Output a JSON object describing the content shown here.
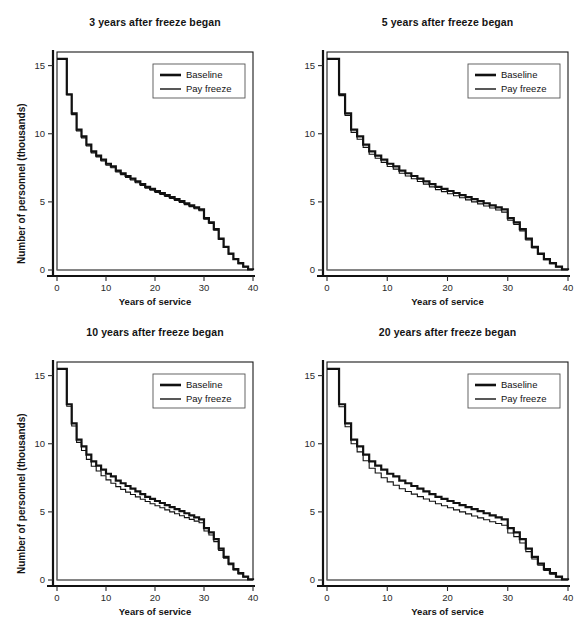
{
  "figure": {
    "panel_layout": "2x2",
    "background": "#ffffff"
  },
  "axis": {
    "xlabel": "Years of service",
    "ylabel": "Number of personnel (thousands)",
    "xticks": [
      "0",
      "10",
      "20",
      "30",
      "40"
    ],
    "yticks": [
      "0",
      "5",
      "10",
      "15"
    ],
    "xlim": [
      0,
      40
    ],
    "ylim": [
      0,
      16
    ]
  },
  "legend": {
    "position": "top-right",
    "entries": [
      {
        "label": "Baseline",
        "color": "#111111",
        "width": 2.6
      },
      {
        "label": "Pay freeze",
        "color": "#111111",
        "width": 1.4
      }
    ]
  },
  "colors": {
    "baseline": "#111111",
    "pay_freeze": "#111111",
    "frame": "#1a1a1a",
    "zero_line": "#8a8a8a",
    "tick": "#2a2a2a"
  },
  "chart_data": {
    "type": "line",
    "xlabel": "Years of service",
    "ylabel": "Number of personnel (thousands)",
    "xlim": [
      0,
      40
    ],
    "ylim": [
      0,
      16
    ],
    "grid": false,
    "legend": [
      "Baseline",
      "Pay freeze"
    ],
    "x": [
      0,
      1,
      2,
      3,
      4,
      5,
      6,
      7,
      8,
      9,
      10,
      11,
      12,
      13,
      14,
      15,
      16,
      17,
      18,
      19,
      20,
      21,
      22,
      23,
      24,
      25,
      26,
      27,
      28,
      29,
      30,
      31,
      32,
      33,
      34,
      35,
      36,
      37,
      38,
      39,
      40
    ],
    "panels": [
      {
        "id": "panel-3-years",
        "title": "3 years after freeze began",
        "series": [
          {
            "name": "Baseline",
            "values": [
              15.5,
              15.5,
              12.9,
              11.5,
              10.3,
              9.8,
              9.2,
              8.7,
              8.4,
              8.1,
              7.8,
              7.6,
              7.3,
              7.1,
              6.9,
              6.7,
              6.5,
              6.3,
              6.1,
              5.95,
              5.8,
              5.65,
              5.5,
              5.35,
              5.2,
              5.05,
              4.9,
              4.75,
              4.6,
              4.45,
              3.8,
              3.5,
              3.0,
              2.3,
              1.7,
              1.2,
              0.8,
              0.5,
              0.25,
              0.05,
              0.0
            ]
          },
          {
            "name": "Pay freeze",
            "values": [
              15.5,
              15.5,
              12.85,
              11.4,
              10.2,
              9.7,
              9.1,
              8.6,
              8.3,
              8.0,
              7.7,
              7.5,
              7.2,
              7.0,
              6.8,
              6.6,
              6.4,
              6.2,
              6.0,
              5.85,
              5.7,
              5.55,
              5.4,
              5.25,
              5.1,
              4.95,
              4.8,
              4.65,
              4.5,
              4.35,
              3.72,
              3.42,
              2.93,
              2.24,
              1.65,
              1.16,
              0.77,
              0.47,
              0.23,
              0.04,
              0.0
            ]
          }
        ]
      },
      {
        "id": "panel-5-years",
        "title": "5 years after freeze began",
        "series": [
          {
            "name": "Baseline",
            "values": [
              15.5,
              15.5,
              12.9,
              11.5,
              10.3,
              9.8,
              9.2,
              8.7,
              8.4,
              8.1,
              7.8,
              7.6,
              7.3,
              7.1,
              6.9,
              6.7,
              6.5,
              6.3,
              6.1,
              5.95,
              5.8,
              5.65,
              5.5,
              5.35,
              5.2,
              5.05,
              4.9,
              4.75,
              4.6,
              4.45,
              3.8,
              3.5,
              3.0,
              2.3,
              1.7,
              1.2,
              0.8,
              0.5,
              0.25,
              0.05,
              0.0
            ]
          },
          {
            "name": "Pay freeze",
            "values": [
              15.5,
              15.5,
              12.8,
              11.35,
              10.1,
              9.6,
              9.0,
              8.5,
              8.2,
              7.9,
              7.6,
              7.4,
              7.1,
              6.9,
              6.7,
              6.5,
              6.3,
              6.1,
              5.9,
              5.75,
              5.6,
              5.45,
              5.3,
              5.15,
              5.0,
              4.85,
              4.7,
              4.55,
              4.4,
              4.25,
              3.65,
              3.35,
              2.87,
              2.2,
              1.62,
              1.14,
              0.75,
              0.46,
              0.22,
              0.04,
              0.0
            ]
          }
        ]
      },
      {
        "id": "panel-10-years",
        "title": "10 years after freeze began",
        "series": [
          {
            "name": "Baseline",
            "values": [
              15.5,
              15.5,
              12.9,
              11.5,
              10.3,
              9.8,
              9.2,
              8.7,
              8.4,
              8.1,
              7.8,
              7.6,
              7.3,
              7.1,
              6.9,
              6.7,
              6.5,
              6.3,
              6.1,
              5.95,
              5.8,
              5.65,
              5.5,
              5.35,
              5.2,
              5.05,
              4.9,
              4.75,
              4.6,
              4.45,
              3.8,
              3.5,
              3.0,
              2.3,
              1.7,
              1.2,
              0.8,
              0.5,
              0.25,
              0.05,
              0.0
            ]
          },
          {
            "name": "Pay freeze",
            "values": [
              15.5,
              15.5,
              12.75,
              11.3,
              10.1,
              9.5,
              8.85,
              8.35,
              8.0,
              7.65,
              7.35,
              7.1,
              6.85,
              6.65,
              6.45,
              6.28,
              6.1,
              5.93,
              5.76,
              5.6,
              5.45,
              5.3,
              5.15,
              5.0,
              4.86,
              4.72,
              4.58,
              4.45,
              4.32,
              4.2,
              3.6,
              3.3,
              2.82,
              2.16,
              1.6,
              1.12,
              0.74,
              0.45,
              0.22,
              0.04,
              0.0
            ]
          }
        ]
      },
      {
        "id": "panel-20-years",
        "title": "20 years after freeze began",
        "series": [
          {
            "name": "Baseline",
            "values": [
              15.5,
              15.5,
              12.9,
              11.5,
              10.3,
              9.8,
              9.2,
              8.7,
              8.4,
              8.1,
              7.8,
              7.6,
              7.3,
              7.1,
              6.9,
              6.7,
              6.5,
              6.3,
              6.1,
              5.95,
              5.8,
              5.65,
              5.5,
              5.35,
              5.2,
              5.05,
              4.9,
              4.75,
              4.6,
              4.45,
              3.8,
              3.5,
              3.0,
              2.3,
              1.7,
              1.2,
              0.8,
              0.5,
              0.25,
              0.05,
              0.0
            ]
          },
          {
            "name": "Pay freeze",
            "values": [
              15.5,
              15.5,
              12.72,
              11.25,
              10.0,
              9.4,
              8.75,
              8.2,
              7.85,
              7.5,
              7.2,
              6.95,
              6.7,
              6.5,
              6.3,
              6.12,
              5.95,
              5.78,
              5.6,
              5.45,
              5.3,
              5.15,
              5.0,
              4.85,
              4.7,
              4.56,
              4.42,
              4.28,
              4.15,
              4.02,
              3.45,
              3.18,
              2.72,
              2.08,
              1.54,
              1.08,
              0.71,
              0.43,
              0.21,
              0.04,
              0.0
            ]
          }
        ]
      }
    ]
  }
}
